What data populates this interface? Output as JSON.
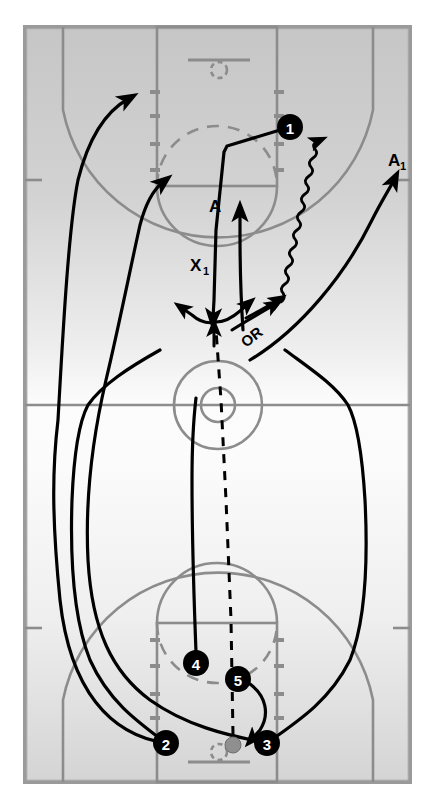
{
  "diagram": {
    "type": "basketball-play-diagram",
    "canvas": {
      "width": 434,
      "height": 810
    }
  },
  "colors": {
    "background": "#ffffff",
    "court_fill_top": "#c8c8c8",
    "court_fill_bottom": "#fbfbfb",
    "court_line": "#8c8c8c",
    "court_border": "#9a9a9a",
    "play_line": "#000000",
    "player_marker": "#000000",
    "player_text": "#ffffff",
    "ball": "#8f8f8f"
  },
  "court": {
    "left": 25,
    "top": 27,
    "width": 385,
    "height": 755,
    "midline_y": 405,
    "center_circle_outer_r": 44,
    "center_circle_inner_r": 17,
    "lane_left": 157,
    "lane_right": 277,
    "top_freethrow_y": 186,
    "bottom_freethrow_y": 623,
    "top_baseline_y": 27,
    "bottom_baseline_y": 782
  },
  "players": [
    {
      "id": "1",
      "label": "1",
      "cx": 290,
      "cy": 127,
      "r": 13,
      "role": "ball-handler-top"
    },
    {
      "id": "2",
      "label": "2",
      "cx": 166,
      "cy": 743,
      "r": 13,
      "role": "wing-left"
    },
    {
      "id": "3",
      "label": "3",
      "cx": 267,
      "cy": 743,
      "r": 13,
      "role": "wing-right"
    },
    {
      "id": "4",
      "label": "4",
      "cx": 196,
      "cy": 663,
      "r": 13,
      "role": "post-left"
    },
    {
      "id": "5",
      "label": "5",
      "cx": 238,
      "cy": 679,
      "r": 13,
      "role": "post-right"
    }
  ],
  "ball": {
    "cx": 233,
    "cy": 745,
    "r": 8,
    "label": "ball"
  },
  "annotations": [
    {
      "id": "A",
      "text": "A",
      "x": 209,
      "y": 212,
      "size": 16
    },
    {
      "id": "A1",
      "text": "A",
      "sub": "1",
      "x": 392,
      "y": 166,
      "size": 16
    },
    {
      "id": "X1",
      "text": "X",
      "sub": "1",
      "x": 194,
      "y": 270,
      "size": 16
    },
    {
      "id": "OR",
      "text": "OR",
      "x": 246,
      "y": 348,
      "size": 14,
      "rotate": -38
    }
  ],
  "movement": {
    "cut_arrows": 7,
    "dribble_lines": 1,
    "pass_lines": 2,
    "screen_lines": 0,
    "description_labels": [
      "A",
      "A1",
      "X1",
      "OR"
    ]
  }
}
